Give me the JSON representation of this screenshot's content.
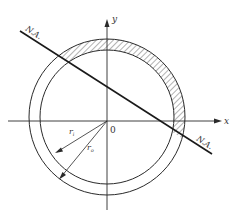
{
  "diagram": {
    "labels": {
      "y_axis": "y",
      "x_axis": "x",
      "origin": "0",
      "neutral_axis_top": "N.A.",
      "neutral_axis_bottom": "N.A.",
      "inner_radius": "r",
      "inner_radius_sub": "i",
      "outer_radius": "r",
      "outer_radius_sub": "o"
    },
    "colors": {
      "line": "#2a2a2a",
      "hatch": "#555555",
      "background": "#ffffff"
    }
  }
}
